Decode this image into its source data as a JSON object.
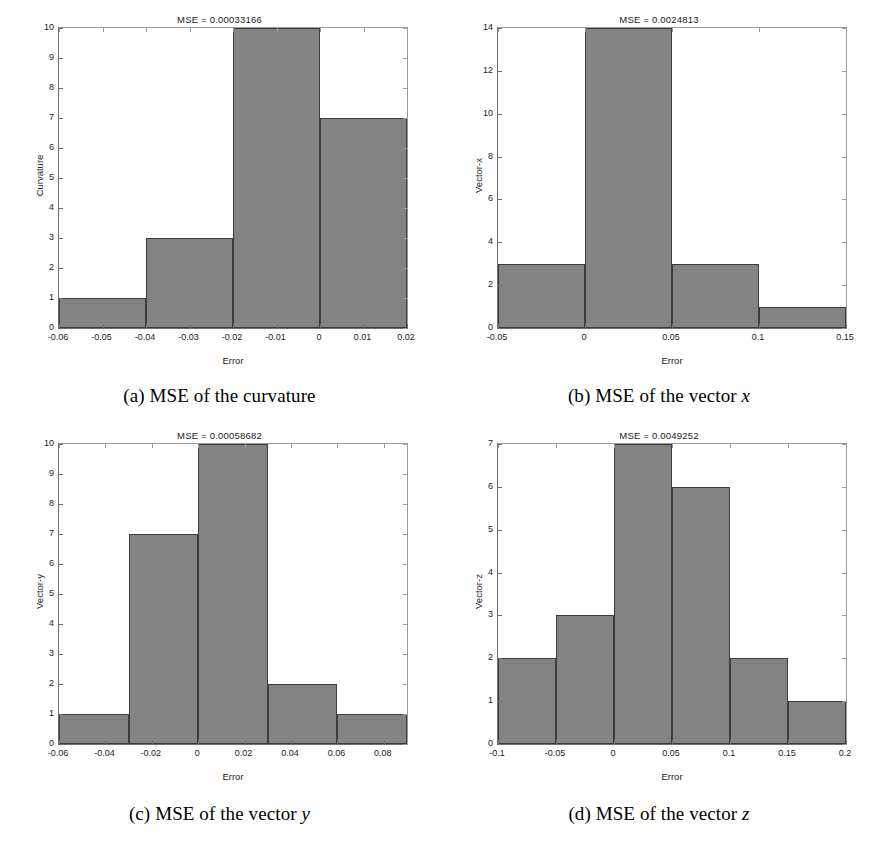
{
  "figure": {
    "background": "#ffffff",
    "bar_fill": "#838383",
    "bar_edge": "#3c3c3c",
    "axis_color": "#6e6e6e"
  },
  "panels": [
    {
      "key": "a",
      "caption_prefix": "(a) MSE of the curvature",
      "caption_italic": "",
      "title": "MSE = 0.00033166",
      "xlabel": "Error",
      "ylabel": "Curvature",
      "xticks": [
        "-0.06",
        "-0.05",
        "-0.04",
        "-0.03",
        "-0.02",
        "-0.01",
        "0",
        "0.01",
        "0.02"
      ],
      "yticks": [
        "0",
        "1",
        "2",
        "3",
        "4",
        "5",
        "6",
        "7",
        "8",
        "9",
        "10"
      ]
    },
    {
      "key": "b",
      "caption_prefix": "(b) MSE of the vector ",
      "caption_italic": "x",
      "title": "MSE = 0.0024813",
      "xlabel": "Error",
      "ylabel": "Vector-x",
      "xticks": [
        "-0.05",
        "0",
        "0.05",
        "0.1",
        "0.15"
      ],
      "yticks": [
        "0",
        "2",
        "4",
        "6",
        "8",
        "10",
        "12",
        "14"
      ]
    },
    {
      "key": "c",
      "caption_prefix": "(c) MSE of the vector ",
      "caption_italic": "y",
      "title": "MSE = 0.00058682",
      "xlabel": "Error",
      "ylabel": "Vector-y",
      "xticks": [
        "-0.06",
        "-0.04",
        "-0.02",
        "0",
        "0.02",
        "0.04",
        "0.06",
        "0.08"
      ],
      "yticks": [
        "0",
        "1",
        "2",
        "3",
        "4",
        "5",
        "6",
        "7",
        "8",
        "9",
        "10"
      ]
    },
    {
      "key": "d",
      "caption_prefix": "(d) MSE of the vector ",
      "caption_italic": "z",
      "title": "MSE = 0.0049252",
      "xlabel": "Error",
      "ylabel": "Vector-z",
      "xticks": [
        "-0.1",
        "-0.05",
        "0",
        "0.05",
        "0.1",
        "0.15",
        "0.2"
      ],
      "yticks": [
        "0",
        "1",
        "2",
        "3",
        "4",
        "5",
        "6",
        "7"
      ]
    }
  ],
  "chart_data": [
    {
      "type": "bar",
      "panel": "a",
      "title": "MSE = 0.00033166",
      "xlabel": "Error",
      "ylabel": "Curvature",
      "xlim": [
        -0.06,
        0.02
      ],
      "ylim": [
        0,
        10
      ],
      "grid": false,
      "legend": "none",
      "bin_edges": [
        -0.06,
        -0.04,
        -0.02,
        0.0,
        0.02
      ],
      "bin_centers": [
        -0.05,
        -0.03,
        -0.01,
        0.01
      ],
      "values": [
        1,
        3,
        10,
        7
      ],
      "xticklabels": [
        "-0.06",
        "-0.05",
        "-0.04",
        "-0.03",
        "-0.02",
        "-0.01",
        "0",
        "0.01",
        "0.02"
      ],
      "xtickvalues": [
        -0.06,
        -0.05,
        -0.04,
        -0.03,
        -0.02,
        -0.01,
        0,
        0.01,
        0.02
      ],
      "yticklabels": [
        "0",
        "1",
        "2",
        "3",
        "4",
        "5",
        "6",
        "7",
        "8",
        "9",
        "10"
      ],
      "ytickvalues": [
        0,
        1,
        2,
        3,
        4,
        5,
        6,
        7,
        8,
        9,
        10
      ]
    },
    {
      "type": "bar",
      "panel": "b",
      "title": "MSE = 0.0024813",
      "xlabel": "Error",
      "ylabel": "Vector-x",
      "xlim": [
        -0.05,
        0.15
      ],
      "ylim": [
        0,
        14
      ],
      "grid": false,
      "legend": "none",
      "bin_edges": [
        -0.05,
        0.0,
        0.05,
        0.1,
        0.15
      ],
      "bin_centers": [
        -0.025,
        0.025,
        0.075,
        0.125
      ],
      "values": [
        3,
        14,
        3,
        1
      ],
      "xticklabels": [
        "-0.05",
        "0",
        "0.05",
        "0.1",
        "0.15"
      ],
      "xtickvalues": [
        -0.05,
        0,
        0.05,
        0.1,
        0.15
      ],
      "yticklabels": [
        "0",
        "2",
        "4",
        "6",
        "8",
        "10",
        "12",
        "14"
      ],
      "ytickvalues": [
        0,
        2,
        4,
        6,
        8,
        10,
        12,
        14
      ]
    },
    {
      "type": "bar",
      "panel": "c",
      "title": "MSE = 0.00058682",
      "xlabel": "Error",
      "ylabel": "Vector-y",
      "xlim": [
        -0.06,
        0.09
      ],
      "ylim": [
        0,
        10
      ],
      "grid": false,
      "legend": "none",
      "bin_edges": [
        -0.06,
        -0.03,
        0.0,
        0.03,
        0.06,
        0.09
      ],
      "bin_centers": [
        -0.045,
        -0.015,
        0.015,
        0.045,
        0.075
      ],
      "values": [
        1,
        7,
        10,
        2,
        1
      ],
      "xticklabels": [
        "-0.06",
        "-0.04",
        "-0.02",
        "0",
        "0.02",
        "0.04",
        "0.06",
        "0.08"
      ],
      "xtickvalues": [
        -0.06,
        -0.04,
        -0.02,
        0,
        0.02,
        0.04,
        0.06,
        0.08
      ],
      "yticklabels": [
        "0",
        "1",
        "2",
        "3",
        "4",
        "5",
        "6",
        "7",
        "8",
        "9",
        "10"
      ],
      "ytickvalues": [
        0,
        1,
        2,
        3,
        4,
        5,
        6,
        7,
        8,
        9,
        10
      ]
    },
    {
      "type": "bar",
      "panel": "d",
      "title": "MSE = 0.0049252",
      "xlabel": "Error",
      "ylabel": "Vector-z",
      "xlim": [
        -0.1,
        0.2
      ],
      "ylim": [
        0,
        7
      ],
      "grid": false,
      "legend": "none",
      "bin_edges": [
        -0.1,
        -0.05,
        0.0,
        0.05,
        0.1,
        0.15,
        0.2
      ],
      "bin_centers": [
        -0.075,
        -0.025,
        0.025,
        0.075,
        0.125,
        0.175
      ],
      "values": [
        2,
        3,
        7,
        6,
        2,
        1
      ],
      "xticklabels": [
        "-0.1",
        "-0.05",
        "0",
        "0.05",
        "0.1",
        "0.15",
        "0.2"
      ],
      "xtickvalues": [
        -0.1,
        -0.05,
        0,
        0.05,
        0.1,
        0.15,
        0.2
      ],
      "yticklabels": [
        "0",
        "1",
        "2",
        "3",
        "4",
        "5",
        "6",
        "7"
      ],
      "ytickvalues": [
        0,
        1,
        2,
        3,
        4,
        5,
        6,
        7
      ]
    }
  ]
}
